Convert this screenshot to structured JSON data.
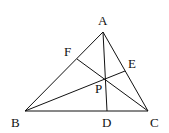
{
  "diagram": {
    "points": {
      "A": {
        "label": "A",
        "x": 103,
        "y": 32,
        "lx": 98,
        "ly": 25
      },
      "B": {
        "label": "B",
        "x": 25,
        "y": 111,
        "lx": 11,
        "ly": 127
      },
      "C": {
        "label": "C",
        "x": 148,
        "y": 111,
        "lx": 150,
        "ly": 127
      },
      "D": {
        "label": "D",
        "x": 107,
        "y": 111,
        "lx": 102,
        "ly": 127
      },
      "E": {
        "label": "E",
        "x": 125,
        "y": 71,
        "lx": 128,
        "ly": 68
      },
      "F": {
        "label": "F",
        "x": 77,
        "y": 59,
        "lx": 64,
        "ly": 56
      },
      "P": {
        "label": "P",
        "x": 106,
        "y": 79,
        "lx": 95,
        "ly": 93
      }
    },
    "segments": [
      [
        "A",
        "B"
      ],
      [
        "A",
        "C"
      ],
      [
        "B",
        "C"
      ],
      [
        "A",
        "D"
      ],
      [
        "B",
        "E"
      ],
      [
        "C",
        "F"
      ]
    ]
  }
}
